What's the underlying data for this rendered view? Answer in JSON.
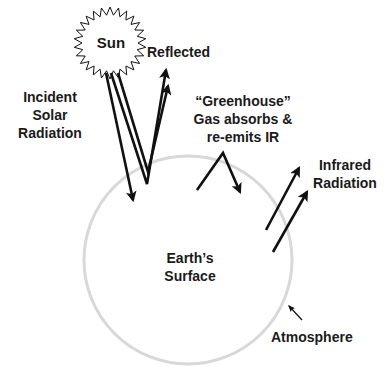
{
  "diagram": {
    "colors": {
      "ink": "#111111",
      "text": "#1a1a1a",
      "atmosphere": "#d8d8d8",
      "background": "#ffffff"
    },
    "sun": {
      "label": "Sun",
      "center": [
        110,
        43
      ],
      "outer_radius": 36,
      "inner_radius": 28,
      "points": 26
    },
    "earth": {
      "label_lines": [
        "Earth’s",
        "Surface"
      ],
      "center": [
        188,
        260
      ],
      "radius": 104
    },
    "labels": {
      "reflected": "Reflected",
      "incident": [
        "Incident",
        "Solar",
        "Radiation"
      ],
      "greenhouse": [
        "“Greenhouse”",
        "Gas absorbs &",
        "re-emits IR"
      ],
      "infrared": [
        "Infrared",
        "Radiation"
      ],
      "atmosphere": "Atmosphere"
    },
    "arrows": [
      {
        "name": "incident-arrow",
        "points": [
          [
            106,
            73
          ],
          [
            133,
            200
          ]
        ]
      },
      {
        "name": "reflected-arrow-outer",
        "points": [
          [
            111,
            73
          ],
          [
            147,
            184
          ],
          [
            166,
            70
          ]
        ]
      },
      {
        "name": "reflected-arrow-inner",
        "points": [
          [
            118,
            73
          ],
          [
            148,
            172
          ],
          [
            168,
            86
          ]
        ]
      },
      {
        "name": "greenhouse-reemit-arrow",
        "points": [
          [
            197,
            190
          ],
          [
            223,
            153
          ],
          [
            240,
            192
          ]
        ]
      },
      {
        "name": "infrared-arrow-1",
        "points": [
          [
            266,
            230
          ],
          [
            299,
            168
          ]
        ]
      },
      {
        "name": "infrared-arrow-2",
        "points": [
          [
            273,
            252
          ],
          [
            307,
            192
          ]
        ]
      },
      {
        "name": "atmosphere-pointer-arrow",
        "points": [
          [
            302,
            320
          ],
          [
            289,
            306
          ]
        ]
      }
    ]
  }
}
